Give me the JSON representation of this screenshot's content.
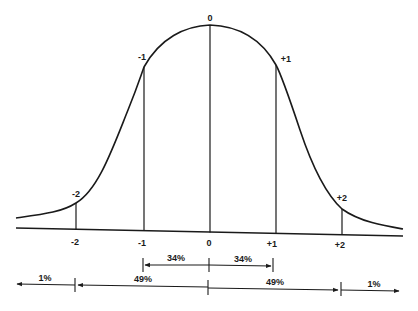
{
  "diagram": {
    "type": "normal-distribution-curve",
    "curve_labels": {
      "center": "0",
      "minus1": "-1",
      "plus1": "+1",
      "minus2": "-2",
      "plus2": "+2"
    },
    "axis_labels": {
      "minus2": "-2",
      "minus1": "-1",
      "zero": "0",
      "plus1": "+1",
      "plus2": "+2"
    },
    "inner_span": {
      "left_pct": "34%",
      "right_pct": "34%"
    },
    "outer_span": {
      "far_left_pct": "1%",
      "left_pct": "49%",
      "right_pct": "49%",
      "far_right_pct": "1%"
    },
    "colors": {
      "line": "#1a1a1a",
      "background": "#ffffff"
    }
  }
}
